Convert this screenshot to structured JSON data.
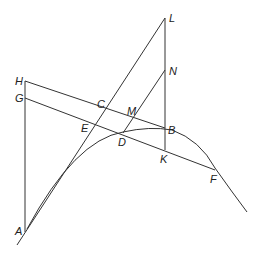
{
  "diagram": {
    "labels": {
      "L": "L",
      "N": "N",
      "H": "H",
      "G": "G",
      "C": "C",
      "M": "M",
      "E": "E",
      "D": "D",
      "B": "B",
      "K": "K",
      "F": "F",
      "A": "A"
    },
    "points": {
      "L": [
        165,
        18
      ],
      "N": [
        165,
        70
      ],
      "B": [
        165,
        128
      ],
      "K": [
        165,
        150
      ],
      "H": [
        25,
        81
      ],
      "G": [
        25,
        98
      ],
      "C": [
        103,
        114
      ],
      "M": [
        134,
        120
      ],
      "E": [
        93,
        124
      ],
      "D": [
        123,
        133
      ],
      "F": [
        215,
        170
      ],
      "A": [
        25,
        232
      ]
    },
    "curve": {
      "description": "parabola from A through D, B, F",
      "end": [
        247,
        212
      ]
    }
  }
}
